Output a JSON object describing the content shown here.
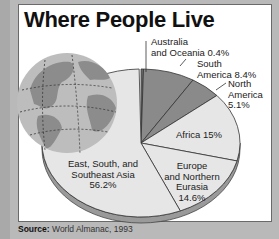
{
  "chart_data": {
    "type": "pie",
    "title": "Where People Live",
    "slices": [
      {
        "label": "Australia and Oceania",
        "value": 0.4,
        "color": "#6e6e6e"
      },
      {
        "label": "South America",
        "value": 8.4,
        "color": "#8a8a8a"
      },
      {
        "label": "North America",
        "value": 5.1,
        "color": "#8a8a8a"
      },
      {
        "label": "Africa",
        "value": 15,
        "color": "#e6e6e6"
      },
      {
        "label": "Europe and Northern Eurasia",
        "value": 14.6,
        "color": "#e6e6e6"
      },
      {
        "label": "East, South, and Southeast Asia",
        "value": 56.2,
        "color": "#e6e6e6"
      }
    ],
    "source": "World Almanac, 1993"
  },
  "title": "Where People Live",
  "labels": {
    "australia_l1": "Australia",
    "australia_l2": "and Oceania  0.4%",
    "south_l1": "South",
    "south_l2": "America  8.4%",
    "north_l1": "North",
    "north_l2": "America",
    "north_l3": "5.1%",
    "africa": "Africa  15%",
    "europe_l1": "Europe",
    "europe_l2": "and Northern",
    "europe_l3": "Eurasia",
    "europe_l4": "14.6%",
    "asia_l1": "East, South, and",
    "asia_l2": "Southeast Asia",
    "asia_l3": "56.2%"
  },
  "source": {
    "prefix": "Source:",
    "text": " World Almanac, 1993"
  }
}
